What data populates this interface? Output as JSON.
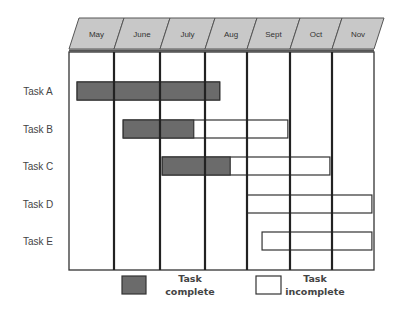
{
  "chart_data": {
    "type": "gantt",
    "title": "",
    "months": [
      "May",
      "June",
      "July",
      "Aug",
      "Sept",
      "Oct",
      "Nov"
    ],
    "tasks": [
      {
        "name": "Task A",
        "start": 0.18,
        "complete_end": 3.35,
        "end": 3.35
      },
      {
        "name": "Task B",
        "start": 1.2,
        "complete_end": 2.75,
        "end": 4.95
      },
      {
        "name": "Task C",
        "start": 2.05,
        "complete_end": 3.6,
        "end": 5.95
      },
      {
        "name": "Task D",
        "start": 4.0,
        "complete_end": 4.0,
        "end": 6.95
      },
      {
        "name": "Task E",
        "start": 4.35,
        "complete_end": 4.35,
        "end": 6.95
      }
    ],
    "legend": [
      {
        "label_line1": "Task",
        "label_line2": "complete",
        "color": "#6b6b6b"
      },
      {
        "label_line1": "Task",
        "label_line2": "incomplete",
        "color": "#ffffff"
      }
    ],
    "colors": {
      "complete": "#6b6b6b",
      "incomplete": "#ffffff",
      "header_fill": "#c8c8c8",
      "grid_line": "#333333"
    }
  }
}
